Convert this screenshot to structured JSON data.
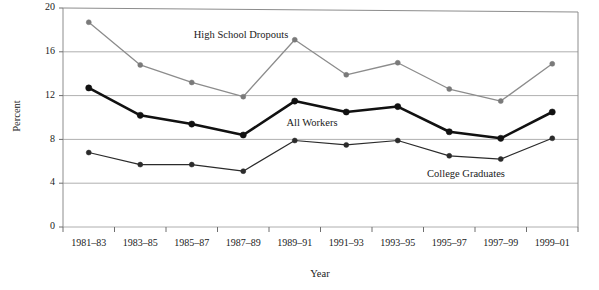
{
  "chart_data": {
    "type": "line",
    "title": "",
    "xlabel": "Year",
    "ylabel": "Percent",
    "categories": [
      "1981–83",
      "1983–85",
      "1985–87",
      "1987–89",
      "1989–91",
      "1991–93",
      "1993–95",
      "1995–97",
      "1997–99",
      "1999–01"
    ],
    "ylim": [
      0,
      20
    ],
    "yticks": [
      0,
      4,
      8,
      12,
      16,
      20
    ],
    "ytick_labels": [
      "0",
      "4",
      "8",
      "12",
      "16",
      "20"
    ],
    "grid": true,
    "grid_axis": "y",
    "legend_position": "inline-annotations",
    "series": [
      {
        "name": "High School Dropouts",
        "color": "#8c8c8c",
        "marker_color": "#7a7a7a",
        "line_width": 1.3,
        "values": [
          18.7,
          14.8,
          13.2,
          11.9,
          17.1,
          13.9,
          15.0,
          12.6,
          11.5,
          14.9
        ],
        "annotation": {
          "label": "High School Dropouts",
          "x_px": 241,
          "y_px": 38
        }
      },
      {
        "name": "All Workers",
        "color": "#111111",
        "marker_color": "#111111",
        "line_width": 2.6,
        "values": [
          12.7,
          10.2,
          9.4,
          8.4,
          11.5,
          10.5,
          11.0,
          8.7,
          8.1,
          10.5
        ],
        "annotation": {
          "label": "All Workers",
          "x_px": 312,
          "y_px": 126
        }
      },
      {
        "name": "College Graduates",
        "color": "#2b2b2b",
        "marker_color": "#2b2b2b",
        "line_width": 1.2,
        "values": [
          6.8,
          5.7,
          5.7,
          5.1,
          7.9,
          7.5,
          7.9,
          6.5,
          6.2,
          8.1
        ],
        "annotation": {
          "label": "College Graduates",
          "x_px": 466,
          "y_px": 177
        }
      }
    ]
  },
  "axes": {
    "y_label": "Percent",
    "x_label": "Year"
  }
}
